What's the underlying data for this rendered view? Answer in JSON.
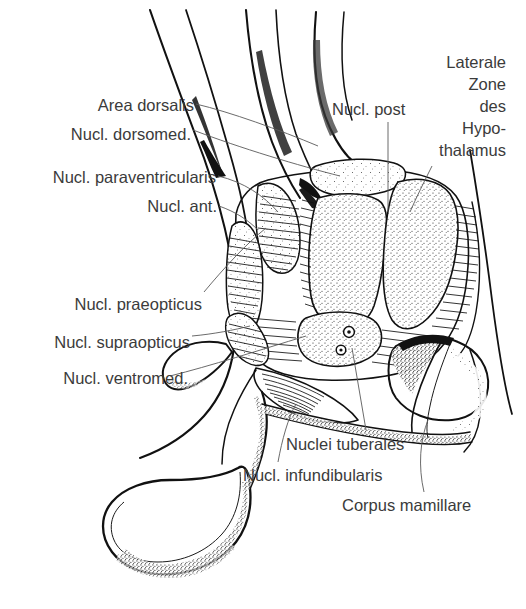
{
  "figure": {
    "background_color": "#ffffff",
    "text_color": "#3b3b3b",
    "line_color": "#111111",
    "leader_color": "#5a5a5a"
  },
  "labels": {
    "area_dorsalis": "Area dorsalis",
    "nucl_dorsomed": "Nucl. dorsomed.",
    "nucl_paraventricularis": "Nucl. paraventricularis",
    "nucl_ant": "Nucl. ant.",
    "nucl_praeopticus": "Nucl. praeopticus",
    "nucl_supraopticus": "Nucl. supraopticus",
    "nucl_ventromed": "Nucl. ventromed.",
    "nucl_post": "Nucl. post",
    "laterale_zone_line1": "Laterale",
    "laterale_zone_line2": "Zone",
    "laterale_zone_line3": "des",
    "laterale_zone_line4": "Hypo-",
    "laterale_zone_line5": "thalamus",
    "nuclei_tuberales": "Nuclei tuberales",
    "nucl_infundibularis": "Nucl. infundibularis",
    "corpus_mamillare": "Corpus mamillare"
  }
}
